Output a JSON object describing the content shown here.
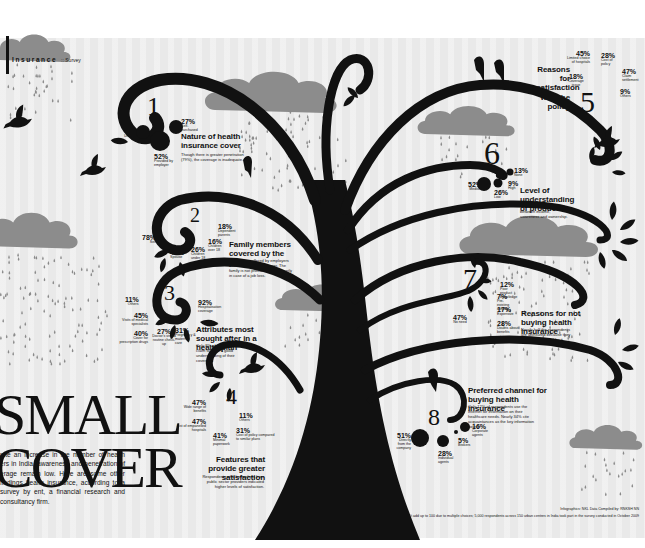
{
  "masthead": {
    "section": "Insurance",
    "separator": "::",
    "category": "Survey"
  },
  "title": {
    "line1": "SMALL",
    "line2": "COVER"
  },
  "intro": "pite an increase in the number of health ers in India, awareness and penetration of erage remain low. Here are some other findings health insurance, according to a survey by ent, a financial research and consultancy firm.",
  "sections": [
    {
      "number": "1",
      "heading": "Nature of health insurance cover",
      "description": "Though there is greater penetration (79%), the coverage is inadequate.",
      "items": [
        {
          "value": "27%",
          "label": "Self-purchased"
        },
        {
          "value": "21%",
          "label": "Uninsured"
        },
        {
          "value": "52%",
          "label": "Provided by employer"
        }
      ]
    },
    {
      "number": "2",
      "heading": "Family members covered by the policy",
      "description": "The policies offered by employers cover only the breadwinner. The family is not provided for sufficiently in case of a job loss.",
      "items": [
        {
          "value": "78%",
          "label": "Self"
        },
        {
          "value": "48%",
          "label": "Spouse"
        },
        {
          "value": "26%",
          "label": "Children under 18"
        },
        {
          "value": "16%",
          "label": "Children over 18"
        },
        {
          "value": "18%",
          "label": "Dependent parents"
        }
      ]
    },
    {
      "number": "3",
      "heading": "Attributes most sought after in a health plan",
      "description": "Only 8% of respondents claim to have a good understanding of their coverage.",
      "items": [
        {
          "value": "11%",
          "label": "Others"
        },
        {
          "value": "45%",
          "label": "Visits of medical specialists"
        },
        {
          "value": "40%",
          "label": "Cover for prescription drugs"
        },
        {
          "value": "27%",
          "label": "Doctor's visit & routine check-up"
        },
        {
          "value": "31%",
          "label": "Pregnancy & maternity care"
        },
        {
          "value": "92%",
          "label": "Hospitalisation coverage"
        }
      ]
    },
    {
      "number": "4",
      "heading": "Features that provide greater satisfaction",
      "description": "Respondents who have plans from public sector providers indicated higher levels of satisfaction.",
      "items": [
        {
          "value": "47%",
          "label": "Wide range of benefits"
        },
        {
          "value": "47%",
          "label": "List of empanelled hospitals"
        },
        {
          "value": "41%",
          "label": "Minimal paperwork"
        },
        {
          "value": "11%",
          "label": "Others"
        },
        {
          "value": "31%",
          "label": "Cost of policy compared to similar plans"
        }
      ]
    },
    {
      "number": "5",
      "heading": "Reasons for dissatisfaction with the policy",
      "description": "",
      "items": [
        {
          "value": "45%",
          "label": "Limited choice of hospitals"
        },
        {
          "value": "28%",
          "label": "Cost of policy"
        },
        {
          "value": "18%",
          "label": "Coverage issue"
        },
        {
          "value": "47%",
          "label": "Claim settlement"
        },
        {
          "value": "9%",
          "label": "Others"
        }
      ]
    },
    {
      "number": "6",
      "heading": "Level of understanding of products",
      "description": "There is no significant link between income, awareness and ownership.",
      "items": [
        {
          "value": "52%",
          "label": "Medium"
        },
        {
          "value": "26%",
          "label": "Low"
        },
        {
          "value": "9%",
          "label": "High"
        },
        {
          "value": "13%",
          "label": "None"
        }
      ]
    },
    {
      "number": "7",
      "heading": "Reasons for not buying health insurance",
      "description": "Nearly half the respondents are uninsured because they don't feel the need for it.",
      "items": [
        {
          "value": "12%",
          "label": "Poor product knowledge"
        },
        {
          "value": "7%",
          "label": "Pre-existing ailment"
        },
        {
          "value": "17%",
          "label": "Expensive"
        },
        {
          "value": "28%",
          "label": "Doubts about benefits"
        },
        {
          "value": "47%",
          "label": "No need"
        }
      ]
    },
    {
      "number": "8",
      "heading": "Preferred channel for buying health insurance",
      "description": "Only 12% of respondents use the Internet for information on their healthcare needs. Nearly 34% cite acquaintances as the key information source.",
      "items": [
        {
          "value": "51%",
          "label": "Directly from the company"
        },
        {
          "value": "28%",
          "label": "Individual agents"
        },
        {
          "value": "5%",
          "label": "Brokers"
        },
        {
          "value": "16%",
          "label": "Corporate agents"
        }
      ]
    }
  ],
  "credit": "Infographics: NKL Data Compiled by: RNKSH NN",
  "footnote": "All figures don't add up to 100 due to multiple choices; 5,000 respondents across 150 urban centres in India took part in the survey conducted in October 2009",
  "colors": {
    "ink": "#111111",
    "cloud": "#8c8c8c",
    "rain": "#8a8a8a",
    "background": "#e9e9e9"
  }
}
